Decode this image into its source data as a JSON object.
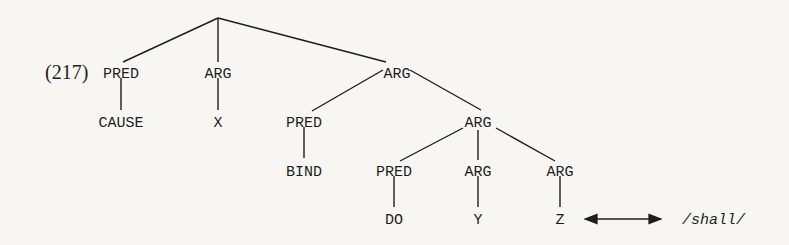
{
  "example": {
    "number": "(217)"
  },
  "tree": {
    "l1": {
      "pred": "PRED",
      "arg1": "ARG",
      "arg2": "ARG"
    },
    "l2": {
      "cause": "CAUSE",
      "x": "X",
      "pred": "PRED",
      "arg": "ARG"
    },
    "l3": {
      "bind": "BIND",
      "pred": "PRED",
      "arg_y": "ARG",
      "arg_z": "ARG"
    },
    "l4": {
      "do": "DO",
      "y": "Y",
      "z": "Z"
    }
  },
  "correspondence": {
    "arrow": "double-headed-arrow",
    "form": "/shall/"
  },
  "colors": {
    "ink": "#1d1d1d",
    "paper": "#f7f6f2"
  }
}
